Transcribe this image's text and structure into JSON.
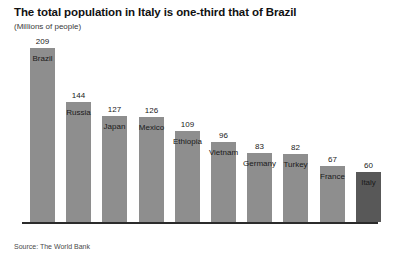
{
  "chart_data": {
    "type": "bar",
    "title": "The total population in Italy is one-third that of Brazil",
    "subtitle": "(Millions of people)",
    "xlabel": "",
    "ylabel": "",
    "ylim": [
      0,
      209
    ],
    "grid": false,
    "legend": null,
    "source": "Source: The World Bank",
    "categories": [
      "Brazil",
      "Russia",
      "Japan",
      "Mexico",
      "Ethiopia",
      "Vietnam",
      "Germany",
      "Turkey",
      "France",
      "Italy"
    ],
    "values": [
      209,
      144,
      127,
      126,
      109,
      96,
      83,
      82,
      67,
      60
    ],
    "bars": [
      {
        "category": "Brazil",
        "value": 209,
        "value_label": "209",
        "highlight": false
      },
      {
        "category": "Russia",
        "value": 144,
        "value_label": "144",
        "highlight": false
      },
      {
        "category": "Japan",
        "value": 127,
        "value_label": "127",
        "highlight": false
      },
      {
        "category": "Mexico",
        "value": 126,
        "value_label": "126",
        "highlight": false
      },
      {
        "category": "Ethiopia",
        "value": 109,
        "value_label": "109",
        "highlight": false
      },
      {
        "category": "Vietnam",
        "value": 96,
        "value_label": "96",
        "highlight": false
      },
      {
        "category": "Germany",
        "value": 83,
        "value_label": "83",
        "highlight": false
      },
      {
        "category": "Turkey",
        "value": 82,
        "value_label": "82",
        "highlight": false
      },
      {
        "category": "France",
        "value": 67,
        "value_label": "67",
        "highlight": false
      },
      {
        "category": "Italy",
        "value": 60,
        "value_label": "60",
        "highlight": true
      }
    ],
    "colors": {
      "bar": "#8e8e8e",
      "bar_highlight": "#585858",
      "axis": "#2b2b2b",
      "title": "#111111",
      "text": "#1a1a1a",
      "background": "#ffffff"
    }
  }
}
